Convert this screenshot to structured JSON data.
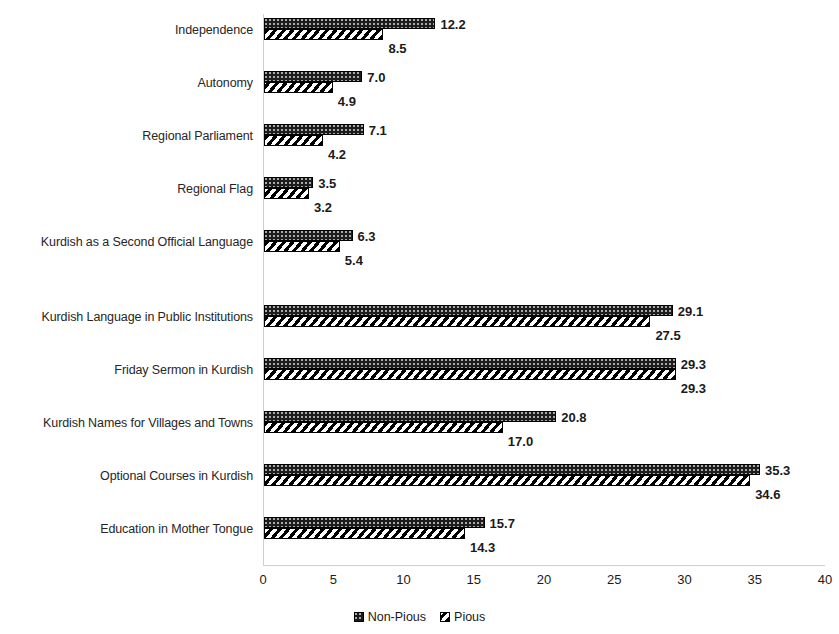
{
  "chart_data": {
    "type": "bar",
    "orientation": "horizontal",
    "title": "",
    "subtitle": "",
    "xlabel": "",
    "ylabel": "",
    "xlim": [
      0,
      40
    ],
    "xticks": [
      "0",
      "5",
      "10",
      "15",
      "20",
      "25",
      "30",
      "35",
      "40"
    ],
    "grid": false,
    "legend_position": "bottom",
    "categories": [
      "Independence",
      "Autonomy",
      "Regional Parliament",
      "Regional Flag",
      "Kurdish as a Second Official Language",
      "Kurdish Language in Public Institutions",
      "Friday Sermon in Kurdish",
      "Kurdish Names for Villages and Towns",
      "Optional Courses in Kurdish",
      "Education in Mother Tongue"
    ],
    "series": [
      {
        "name": "Non-Pious",
        "values": [
          12.2,
          7.0,
          7.1,
          3.5,
          6.3,
          29.1,
          29.3,
          20.8,
          35.3,
          15.7
        ],
        "labels": [
          "12.2",
          "7.0",
          "7.1",
          "3.5",
          "6.3",
          "29.1",
          "29.3",
          "20.8",
          "35.3",
          "15.7"
        ],
        "pattern": "dark-stipple",
        "color": "#1c1c1c"
      },
      {
        "name": "Pious",
        "values": [
          8.5,
          4.9,
          4.2,
          3.2,
          5.4,
          27.5,
          29.3,
          17.0,
          34.6,
          14.3
        ],
        "labels": [
          "8.5",
          "4.9",
          "4.2",
          "3.2",
          "5.4",
          "27.5",
          "29.3",
          "17.0",
          "34.6",
          "14.3"
        ],
        "pattern": "diagonal-hatch",
        "color": "#ffffff"
      }
    ]
  },
  "legend": {
    "items": [
      {
        "label": "Non-Pious",
        "swatch": "dark-stipple-swatch"
      },
      {
        "label": "Pious",
        "swatch": "diagonal-hatch-swatch"
      }
    ]
  }
}
